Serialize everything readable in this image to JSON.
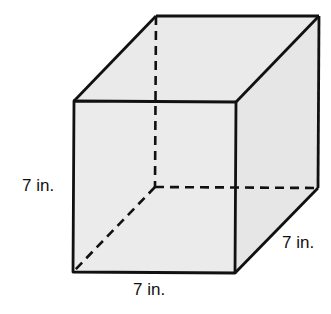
{
  "diagram": {
    "type": "cube",
    "colors": {
      "fill": "#eaeaea",
      "stroke": "#111111",
      "background": "#ffffff"
    },
    "vertices": {
      "front_top_left": [
        74,
        101
      ],
      "front_top_right": [
        236,
        102
      ],
      "front_bottom_left": [
        73,
        272
      ],
      "front_bottom_right": [
        235,
        273
      ],
      "back_top_left": [
        156,
        16
      ],
      "back_top_right": [
        319,
        16
      ],
      "back_bottom_left": [
        155,
        187
      ],
      "back_bottom_right": [
        318,
        188
      ]
    },
    "dimensions": {
      "height": {
        "value": 7,
        "unit": "in.",
        "text": "7 in."
      },
      "width": {
        "value": 7,
        "unit": "in.",
        "text": "7 in."
      },
      "depth": {
        "value": 7,
        "unit": "in.",
        "text": "7 in."
      }
    },
    "labels": {
      "left": "7 in.",
      "bottom": "7 in.",
      "right": "7 in."
    }
  }
}
